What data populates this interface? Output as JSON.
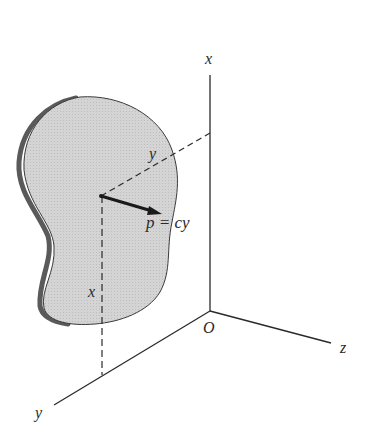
{
  "diagram": {
    "type": "3d-coordinate-figure",
    "axes": {
      "x_label": "x",
      "y_label": "y",
      "z_label": "z",
      "origin_label": "O"
    },
    "plate": {
      "fill_color": "#d2d2d2",
      "edge_color": "#555555"
    },
    "dimensions": {
      "y_label": "y",
      "x_label": "x"
    },
    "pressure": {
      "label": "p = cy"
    },
    "colors": {
      "line": "#2a2a2a",
      "plate": "#d2d2d2",
      "plate_edge": "#5a5a5a"
    }
  }
}
